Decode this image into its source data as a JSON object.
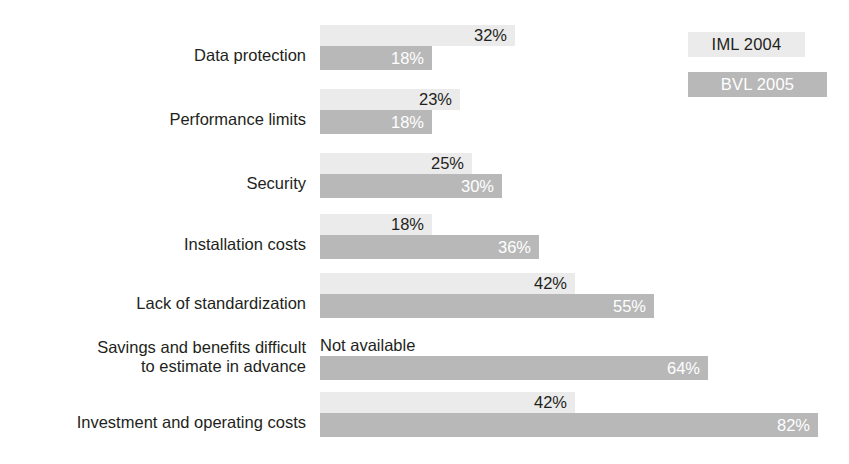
{
  "legend": {
    "items": [
      {
        "label": "IML 2004",
        "style": "light",
        "color": "#ebebeb"
      },
      {
        "label": "BVL 2005",
        "style": "dark",
        "color": "#b8b8b8"
      }
    ]
  },
  "not_available_text": "Not available",
  "chart_data": {
    "type": "bar",
    "orientation": "horizontal",
    "title": "",
    "xlabel": "",
    "ylabel": "",
    "xlim": [
      0,
      100
    ],
    "grid": false,
    "legend_position": "top-right",
    "value_suffix": "%",
    "categories": [
      "Data protection",
      "Performance limits",
      "Security",
      "Installation costs",
      "Lack of standardization",
      "Savings and benefits difficult to estimate in advance",
      "Investment and operating costs"
    ],
    "series": [
      {
        "name": "IML 2004",
        "color": "#ebebeb",
        "values": [
          32,
          23,
          25,
          18,
          42,
          null,
          42
        ],
        "labels": [
          "32%",
          "23%",
          "25%",
          "18%",
          "42%",
          "Not available",
          "42%"
        ]
      },
      {
        "name": "BVL 2005",
        "color": "#b8b8b8",
        "values": [
          18,
          18,
          30,
          36,
          55,
          64,
          82
        ],
        "labels": [
          "18%",
          "18%",
          "30%",
          "36%",
          "55%",
          "64%",
          "82%"
        ]
      }
    ]
  },
  "rows": [
    {
      "label_line1": "Data protection",
      "label_line2": "",
      "top": 25,
      "label_top": 46,
      "light": {
        "value": 32,
        "text": "32%",
        "width": 195,
        "outside": false
      },
      "dark": {
        "value": 18,
        "text": "18%",
        "width": 112,
        "outside": false
      }
    },
    {
      "label_line1": "Performance limits",
      "label_line2": "",
      "top": 89,
      "label_top": 110,
      "light": {
        "value": 23,
        "text": "23%",
        "width": 140,
        "outside": false
      },
      "dark": {
        "value": 18,
        "text": "18%",
        "width": 112,
        "outside": false
      }
    },
    {
      "label_line1": "Security",
      "label_line2": "",
      "top": 153,
      "label_top": 174,
      "light": {
        "value": 25,
        "text": "25%",
        "width": 152,
        "outside": false
      },
      "dark": {
        "value": 30,
        "text": "30%",
        "width": 182,
        "outside": false
      }
    },
    {
      "label_line1": "Installation costs",
      "label_line2": "",
      "top": 214,
      "label_top": 235,
      "light": {
        "value": 18,
        "text": "18%",
        "width": 112,
        "outside": false
      },
      "dark": {
        "value": 36,
        "text": "36%",
        "width": 219,
        "outside": false
      }
    },
    {
      "label_line1": "Lack of standardization",
      "label_line2": "",
      "top": 273,
      "label_top": 294,
      "light": {
        "value": 42,
        "text": "42%",
        "width": 255,
        "outside": false
      },
      "dark": {
        "value": 55,
        "text": "55%",
        "width": 334,
        "outside": false
      }
    },
    {
      "label_line1": "Savings and benefits difficult",
      "label_line2": "to estimate in advance",
      "top": 335,
      "label_top": 338,
      "light": null,
      "dark": {
        "value": 64,
        "text": "64%",
        "width": 388,
        "outside": false
      }
    },
    {
      "label_line1": "Investment and operating costs",
      "label_line2": "",
      "top": 392,
      "label_top": 413,
      "light": {
        "value": 42,
        "text": "42%",
        "width": 255,
        "outside": false
      },
      "dark": {
        "value": 82,
        "text": "82%",
        "width": 498,
        "outside": false
      }
    }
  ]
}
